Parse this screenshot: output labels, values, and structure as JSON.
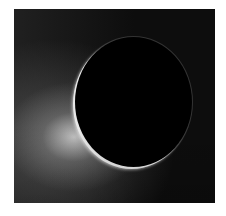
{
  "image": {
    "subject": "backlit moon disk with bright crescent rim and plume glow",
    "colors": {
      "background": "#ffffff",
      "sky": "#0d0d0d",
      "disk": "#000000",
      "rim": "#e8e8e8",
      "glow": "#bfbfbf"
    }
  }
}
